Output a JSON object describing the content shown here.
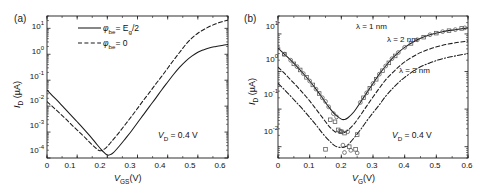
{
  "figure": {
    "background": "#ffffff",
    "line_color": "#1a1a1a",
    "marker_color": "#555555"
  },
  "panel_a": {
    "tag": "(a)",
    "xlabel_main": "V",
    "xlabel_sub": "GS",
    "xlabel_unit": "(V)",
    "ylabel_main": "I",
    "ylabel_sub": "D",
    "ylabel_unit": " (µA)",
    "xticks": [
      "0",
      "0.1",
      "0.2",
      "0.3",
      "0.4",
      "0.5",
      "0.6"
    ],
    "yticks": [
      "10",
      "10",
      "10",
      "10",
      "10",
      "10"
    ],
    "yexps": [
      "1",
      "0",
      "-1",
      "-2",
      "-3",
      "-4"
    ],
    "annotation": {
      "symbol": "V",
      "sub": "D",
      "value": " = 0.4 V"
    },
    "legend": [
      {
        "style": "solid",
        "symbol": "φ",
        "sub": "be",
        "value": "= E",
        "value_sub": "g",
        "value_tail": "/2"
      },
      {
        "style": "dashed",
        "symbol": "φ",
        "sub": "be",
        "value": "= 0",
        "value_sub": "",
        "value_tail": ""
      }
    ]
  },
  "panel_b": {
    "tag": "(b)",
    "xlabel_main": "V",
    "xlabel_sub": "G",
    "xlabel_unit": "(V)",
    "ylabel_main": "I",
    "ylabel_sub": "D",
    "ylabel_unit": " (µA)",
    "xticks": [
      "0",
      "0.1",
      "0.2",
      "0.3",
      "0.4",
      "0.5",
      "0.6"
    ],
    "yticks": [
      "10",
      "10",
      "10",
      "10"
    ],
    "yexps": [
      "1",
      "0",
      "-1",
      "-2"
    ],
    "annotation": {
      "symbol": "V",
      "sub": "D",
      "value": " = 0.4 V"
    },
    "curve_labels": [
      {
        "text": "λ = 1 nm"
      },
      {
        "text": "λ = 2 nm"
      },
      {
        "text": "λ = 3 nm"
      }
    ]
  },
  "chart_data": [
    {
      "type": "line",
      "id": "panel_a",
      "title": "(a)",
      "xlabel": "V_GS (V)",
      "ylabel": "I_D (µA)",
      "xlim": [
        0,
        0.6
      ],
      "ylim": [
        0.0001,
        30
      ],
      "yscale": "log",
      "xticks": [
        0,
        0.1,
        0.2,
        0.3,
        0.4,
        0.5,
        0.6
      ],
      "yticks": [
        0.0001,
        0.001,
        0.01,
        0.1,
        1,
        10
      ],
      "grid": false,
      "legend_position": "upper-center",
      "annotations": [
        "V_D = 0.4 V"
      ],
      "series": [
        {
          "name": "φ_be = E_g/2",
          "style": "solid",
          "x": [
            0.0,
            0.02,
            0.04,
            0.06,
            0.08,
            0.1,
            0.12,
            0.14,
            0.16,
            0.18,
            0.19,
            0.2,
            0.21,
            0.22,
            0.24,
            0.26,
            0.28,
            0.3,
            0.32,
            0.34,
            0.36,
            0.38,
            0.4,
            0.42,
            0.44,
            0.46,
            0.48,
            0.5,
            0.52,
            0.54,
            0.56,
            0.58,
            0.6
          ],
          "y": [
            0.042,
            0.024,
            0.014,
            0.0078,
            0.0044,
            0.0025,
            0.0014,
            0.00076,
            0.0004,
            0.00021,
            0.00016,
            0.00013,
            0.000135,
            0.00016,
            0.00029,
            0.00056,
            0.0011,
            0.0023,
            0.0047,
            0.0098,
            0.02,
            0.042,
            0.085,
            0.17,
            0.32,
            0.55,
            0.85,
            1.2,
            1.5,
            1.8,
            2.0,
            2.2,
            2.4
          ]
        },
        {
          "name": "φ_be = 0",
          "style": "dashed",
          "x": [
            0.0,
            0.02,
            0.04,
            0.06,
            0.08,
            0.1,
            0.12,
            0.14,
            0.16,
            0.175,
            0.19,
            0.2,
            0.21,
            0.22,
            0.24,
            0.26,
            0.28,
            0.3,
            0.32,
            0.34,
            0.36,
            0.38,
            0.4,
            0.42,
            0.44,
            0.46,
            0.48,
            0.5,
            0.52,
            0.54,
            0.56,
            0.58,
            0.6
          ],
          "y": [
            0.015,
            0.0092,
            0.0056,
            0.0034,
            0.002,
            0.0012,
            0.00072,
            0.00042,
            0.00025,
            0.00019,
            0.00022,
            0.00028,
            0.00038,
            0.00052,
            0.001,
            0.002,
            0.004,
            0.0082,
            0.017,
            0.034,
            0.07,
            0.14,
            0.29,
            0.6,
            1.2,
            2.4,
            4.2,
            6.5,
            9.0,
            12.0,
            15.0,
            18.0,
            21.0
          ]
        }
      ]
    },
    {
      "type": "line",
      "id": "panel_b",
      "title": "(b)",
      "xlabel": "V_G (V)",
      "ylabel": "I_D (µA)",
      "xlim": [
        0,
        0.6
      ],
      "ylim": [
        0.005,
        30
      ],
      "yscale": "log",
      "xticks": [
        0,
        0.1,
        0.2,
        0.3,
        0.4,
        0.5,
        0.6
      ],
      "yticks": [
        0.01,
        0.1,
        1,
        10
      ],
      "grid": false,
      "legend_position": "inline-labels",
      "annotations": [
        "V_D = 0.4 V"
      ],
      "series": [
        {
          "name": "λ = 1 nm",
          "style": "solid",
          "x": [
            0.0,
            0.02,
            0.04,
            0.06,
            0.08,
            0.1,
            0.12,
            0.14,
            0.16,
            0.18,
            0.2,
            0.21,
            0.22,
            0.24,
            0.26,
            0.28,
            0.3,
            0.32,
            0.34,
            0.36,
            0.38,
            0.4,
            0.44,
            0.48,
            0.52,
            0.56,
            0.6
          ],
          "y": [
            4.2,
            2.9,
            2.0,
            1.35,
            0.88,
            0.56,
            0.34,
            0.2,
            0.115,
            0.072,
            0.054,
            0.053,
            0.058,
            0.085,
            0.15,
            0.27,
            0.48,
            0.85,
            1.4,
            2.2,
            3.2,
            4.4,
            7.0,
            9.5,
            11.5,
            13.0,
            14.5
          ]
        },
        {
          "name": "λ = 2 nm",
          "style": "dashed",
          "x": [
            0.0,
            0.02,
            0.04,
            0.06,
            0.08,
            0.1,
            0.12,
            0.14,
            0.16,
            0.18,
            0.2,
            0.21,
            0.22,
            0.24,
            0.26,
            0.28,
            0.3,
            0.32,
            0.34,
            0.36,
            0.38,
            0.4,
            0.44,
            0.48,
            0.52,
            0.56,
            0.6
          ],
          "y": [
            1.3,
            0.9,
            0.6,
            0.4,
            0.26,
            0.165,
            0.1,
            0.06,
            0.036,
            0.025,
            0.023,
            0.024,
            0.027,
            0.04,
            0.068,
            0.12,
            0.21,
            0.36,
            0.6,
            0.9,
            1.3,
            1.8,
            2.9,
            4.0,
            5.0,
            5.8,
            6.5
          ]
        },
        {
          "name": "λ = 3 nm",
          "style": "dashdot",
          "x": [
            0.0,
            0.02,
            0.04,
            0.06,
            0.08,
            0.1,
            0.12,
            0.14,
            0.16,
            0.18,
            0.2,
            0.21,
            0.22,
            0.24,
            0.26,
            0.28,
            0.3,
            0.32,
            0.34,
            0.36,
            0.38,
            0.4,
            0.44,
            0.48,
            0.52,
            0.56,
            0.6
          ],
          "y": [
            0.48,
            0.33,
            0.22,
            0.145,
            0.095,
            0.06,
            0.038,
            0.023,
            0.015,
            0.0105,
            0.0095,
            0.0098,
            0.011,
            0.017,
            0.028,
            0.048,
            0.08,
            0.13,
            0.22,
            0.34,
            0.5,
            0.7,
            1.2,
            1.7,
            2.2,
            2.6,
            3.0
          ]
        },
        {
          "name": "measured-circles",
          "style": "markers-circle",
          "x": [
            0.0,
            0.02,
            0.04,
            0.06,
            0.08,
            0.1,
            0.12,
            0.14,
            0.15,
            0.16,
            0.175,
            0.185,
            0.195,
            0.2,
            0.205,
            0.21,
            0.22,
            0.23,
            0.25,
            0.26,
            0.28,
            0.3,
            0.32,
            0.34,
            0.36,
            0.38,
            0.4,
            0.44,
            0.48,
            0.52,
            0.56,
            0.59
          ],
          "y": [
            4.2,
            2.9,
            2.0,
            1.35,
            0.88,
            0.56,
            0.34,
            0.2,
            0.16,
            0.115,
            0.076,
            0.062,
            0.026,
            0.025,
            0.011,
            0.007,
            0.025,
            0.008,
            0.0068,
            0.15,
            0.27,
            0.48,
            0.85,
            1.4,
            2.2,
            3.2,
            4.4,
            7.0,
            9.5,
            11.5,
            13.0,
            14.5
          ]
        },
        {
          "name": "measured-squares",
          "style": "markers-square",
          "x": [
            0.02,
            0.05,
            0.07,
            0.09,
            0.11,
            0.13,
            0.15,
            0.165,
            0.18,
            0.19,
            0.2,
            0.21,
            0.225,
            0.245,
            0.25,
            0.27,
            0.29,
            0.31,
            0.33,
            0.35,
            0.37,
            0.42,
            0.46,
            0.5,
            0.54,
            0.58
          ],
          "y": [
            2.9,
            1.6,
            1.1,
            0.7,
            0.44,
            0.26,
            0.0085,
            0.052,
            0.046,
            0.028,
            0.025,
            0.023,
            0.01,
            0.0085,
            0.021,
            0.2,
            0.36,
            0.62,
            1.05,
            1.7,
            2.6,
            5.6,
            8.2,
            10.5,
            12.2,
            14.0
          ]
        }
      ]
    }
  ]
}
